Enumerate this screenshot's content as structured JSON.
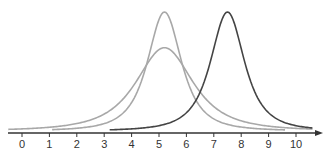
{
  "chart_data": {
    "type": "line",
    "title": "",
    "xlabel": "",
    "ylabel": "",
    "xlim": [
      0,
      10.7
    ],
    "x_ticks": [
      0,
      1,
      2,
      3,
      4,
      5,
      6,
      7,
      8,
      9,
      10
    ],
    "x_tick_labels": [
      "0",
      "1",
      "2",
      "3",
      "4",
      "5",
      "6",
      "7",
      "8",
      "9",
      "10"
    ],
    "grid": false,
    "legend": null,
    "y_axis_visible": false,
    "series": [
      {
        "name": "narrow-gray-curve",
        "shape": "bell",
        "center": 5.2,
        "relative_peak": 1.0,
        "width": 0.95,
        "x_range": [
          1.1,
          9.6
        ],
        "color": "#a8a8a8"
      },
      {
        "name": "wide-gray-curve",
        "shape": "bell",
        "center": 5.2,
        "relative_peak": 0.7,
        "width": 1.6,
        "x_range": [
          -0.5,
          10.6
        ],
        "color": "#a8a8a8"
      },
      {
        "name": "dark-curve",
        "shape": "bell",
        "center": 7.5,
        "relative_peak": 1.0,
        "width": 0.95,
        "x_range": [
          3.2,
          10.6
        ],
        "color": "#444444"
      }
    ],
    "annotations": []
  },
  "axis": {
    "color": "#333333",
    "arrow": true
  }
}
